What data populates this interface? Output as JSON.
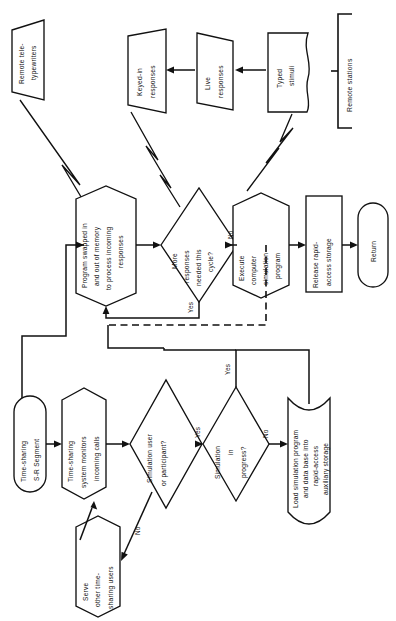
{
  "diagram": {
    "orientation": "rotated-90-ccw",
    "background_color": "#ffffff",
    "line_color": "#111111",
    "nodes": {
      "remote_teletypewriters": {
        "label_line1": "Remote tele-",
        "label_line2": "typewriters",
        "shape": "parallelogram"
      },
      "keyed_in_responses": {
        "label_line1": "Keyed-in",
        "label_line2": "responses",
        "shape": "parallelogram"
      },
      "live_responses": {
        "label_line1": "Live",
        "label_line2": "responses",
        "shape": "parallelogram"
      },
      "typed_stimuli": {
        "label_line1": "Typed",
        "label_line2": "stimuli",
        "shape": "document"
      },
      "remote_stations": {
        "label": "Remote stations",
        "shape": "bracket-annotation"
      },
      "program_swapped": {
        "label_line1": "Program swapped in",
        "label_line2": "and out of memory",
        "label_line3": "to process incoming",
        "label_line4": "responses",
        "shape": "hexagon"
      },
      "more_responses": {
        "label_line1": "More",
        "label_line2": "responses",
        "label_line3": "needed this",
        "label_line4": "cycle?",
        "shape": "diamond"
      },
      "execute_simulation": {
        "label_line1": "Execute",
        "label_line2": "computer",
        "label_line3": "simulation",
        "label_line4": "program",
        "shape": "hexagon"
      },
      "release_storage": {
        "label_line1": "Release rapid-",
        "label_line2": "access storage",
        "shape": "rectangle"
      },
      "return": {
        "label": "Return",
        "shape": "terminator"
      },
      "ts_segment": {
        "label_line1": "Time-sharing",
        "label_line2": "S-R Segment",
        "shape": "terminator"
      },
      "ts_monitors": {
        "label_line1": "Time-sharing",
        "label_line2": "system monitors",
        "label_line3": "incoming calls",
        "shape": "hexagon"
      },
      "serve_other_users": {
        "label_line1": "Serve",
        "label_line2": "other time-",
        "label_line3": "sharing users",
        "shape": "hexagon"
      },
      "simulation_user": {
        "label_line1": "Simulation user",
        "label_line2": "or participant?",
        "shape": "diamond"
      },
      "simulation_in_progress": {
        "label_line1": "Simulation",
        "label_line2": "in",
        "label_line3": "progress?",
        "shape": "diamond"
      },
      "load_simulation": {
        "label_line1": "Load simulation program",
        "label_line2": "and data base into",
        "label_line3": "rapid-access",
        "label_line4": "auxiliary storage",
        "shape": "stored-data"
      }
    },
    "edge_labels": {
      "more_responses_yes": "Yes",
      "more_responses_no": "No",
      "sim_user_yes": "Yes",
      "sim_user_no": "No",
      "sim_progress_yes": "Yes",
      "sim_progress_no": "No"
    }
  }
}
